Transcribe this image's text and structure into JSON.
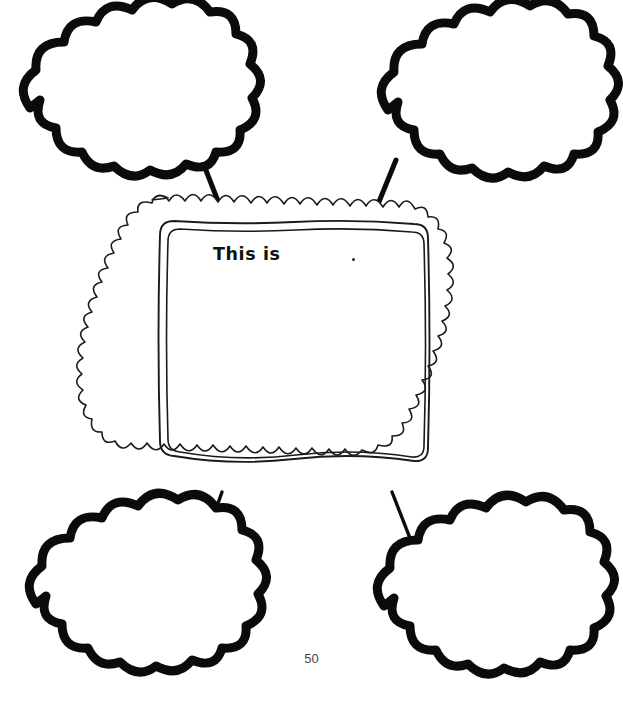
{
  "page": {
    "title": "This is",
    "page_number": "50",
    "background_color": "#ffffff",
    "ink_color": "#0b0b0b",
    "frame_ink_color": "#1b1b1b"
  },
  "center_frame": {
    "name": "center-topic-frame",
    "prompt_label": "This is",
    "prompt_dot": ".",
    "answer_value": "",
    "answer_placeholder": ""
  },
  "bubbles": [
    {
      "id": "bubble-top-left",
      "position": "top-left",
      "value": "",
      "placeholder": ""
    },
    {
      "id": "bubble-top-right",
      "position": "top-right",
      "value": "",
      "placeholder": ""
    },
    {
      "id": "bubble-bottom-left",
      "position": "bottom-left",
      "value": "",
      "placeholder": ""
    },
    {
      "id": "bubble-bottom-right",
      "position": "bottom-right",
      "value": "",
      "placeholder": ""
    }
  ],
  "connectors": [
    {
      "id": "connector-top-left",
      "from": "center-topic-frame",
      "to": "bubble-top-left"
    },
    {
      "id": "connector-top-right",
      "from": "center-topic-frame",
      "to": "bubble-top-right"
    },
    {
      "id": "connector-bottom-left",
      "from": "center-topic-frame",
      "to": "bubble-bottom-left"
    },
    {
      "id": "connector-bottom-right",
      "from": "center-topic-frame",
      "to": "bubble-bottom-right"
    }
  ]
}
